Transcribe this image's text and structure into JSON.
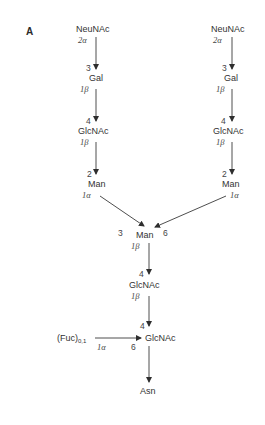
{
  "panel_label": "A",
  "branch_left": {
    "residues": [
      "NeuNAc",
      "Gal",
      "GlcNAc",
      "Man"
    ],
    "linkages": [
      {
        "from_anomer": "2α",
        "to_position": "3"
      },
      {
        "from_anomer": "1β",
        "to_position": "4"
      },
      {
        "from_anomer": "1β",
        "to_position": "2"
      },
      {
        "from_anomer": "1α",
        "to_position": "3"
      }
    ]
  },
  "branch_right": {
    "residues": [
      "NeuNAc",
      "Gal",
      "GlcNAc",
      "Man"
    ],
    "linkages": [
      {
        "from_anomer": "2α",
        "to_position": "3"
      },
      {
        "from_anomer": "1β",
        "to_position": "4"
      },
      {
        "from_anomer": "1β",
        "to_position": "2"
      },
      {
        "from_anomer": "1α",
        "to_position": "6"
      }
    ]
  },
  "core": {
    "residues": [
      "Man",
      "GlcNAc",
      "GlcNAc",
      "Asn"
    ],
    "man_anomer": "1β",
    "glcnac1_position": "4",
    "glcnac1_anomer": "1β",
    "glcnac2_position": "4"
  },
  "fucose": {
    "name": "(Fuc)",
    "subscript": "0,1",
    "anomer": "1α",
    "position": "6"
  },
  "colors": {
    "text": "#333333",
    "lines": "#3a3a3a",
    "background": "#ffffff"
  }
}
